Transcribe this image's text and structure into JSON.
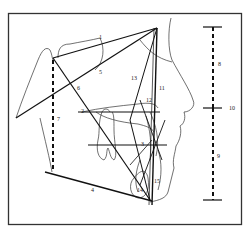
{
  "figure": {
    "type": "cephalometric-tracing",
    "colors": {
      "line": "#1a1a1a",
      "background": "#ffffff",
      "frame": "#333333"
    },
    "line_labels": [
      {
        "id": "1",
        "x": 99,
        "y": 34
      },
      {
        "id": "2",
        "x": 81,
        "y": 108
      },
      {
        "id": "3",
        "x": 141,
        "y": 141
      },
      {
        "id": "4",
        "x": 91,
        "y": 187
      },
      {
        "id": "5",
        "x": 99,
        "y": 69
      },
      {
        "id": "6",
        "x": 77,
        "y": 85
      },
      {
        "id": "7",
        "x": 57,
        "y": 116
      },
      {
        "id": "8",
        "x": 218,
        "y": 61
      },
      {
        "id": "9",
        "x": 217,
        "y": 153
      },
      {
        "id": "10",
        "x": 229,
        "y": 105
      },
      {
        "id": "11",
        "x": 159,
        "y": 85
      },
      {
        "id": "12",
        "x": 146,
        "y": 97
      },
      {
        "id": "13",
        "x": 131,
        "y": 75
      },
      {
        "id": "14",
        "x": 137,
        "y": 187
      },
      {
        "id": "15",
        "x": 154,
        "y": 178
      }
    ],
    "scale_bar": {
      "upper_label": "8",
      "lower_label": "9",
      "total_label": "10"
    }
  }
}
